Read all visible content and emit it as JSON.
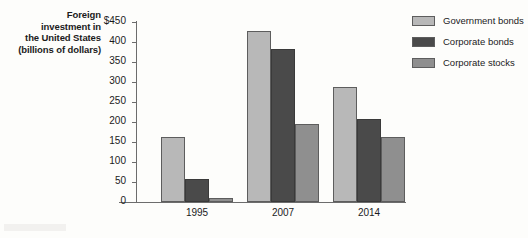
{
  "chart_data": {
    "type": "bar",
    "title": "",
    "subtitle": "",
    "xlabel": "",
    "ylabel": "Foreign investment in the United States (billions of dollars)",
    "ylabel_lines": [
      "Foreign",
      "investment in",
      "the United States",
      "(billions of dollars)"
    ],
    "categories": [
      "1995",
      "2007",
      "2014"
    ],
    "series": [
      {
        "name": "Government bonds",
        "color": "#b8b8b8",
        "values": [
          162,
          428,
          287
        ]
      },
      {
        "name": "Corporate bonds",
        "color": "#4a4a4a",
        "values": [
          57,
          382,
          208
        ]
      },
      {
        "name": "Corporate stocks",
        "color": "#8f8f8f",
        "values": [
          11,
          195,
          163
        ]
      }
    ],
    "ylim": [
      0,
      450
    ],
    "ytick_step": 50,
    "yticks": [
      450,
      400,
      350,
      300,
      250,
      200,
      150,
      100,
      50,
      0
    ],
    "ytick_labels": [
      "$450",
      "400",
      "350",
      "300",
      "250",
      "200",
      "150",
      "100",
      "50",
      "0"
    ],
    "grid": false,
    "legend_position": "right-top",
    "legend": [
      "Government bonds",
      "Corporate bonds",
      "Corporate stocks"
    ]
  }
}
